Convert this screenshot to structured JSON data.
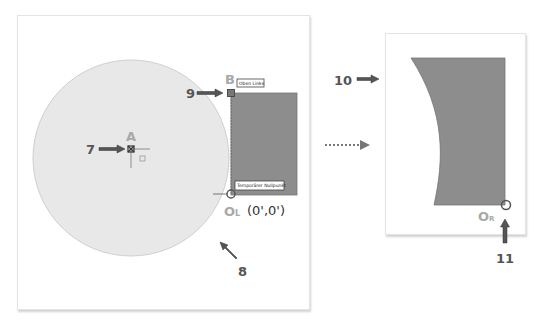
{
  "colors": {
    "circle_fill": "#e8e8e8",
    "circle_stroke": "#c8c8c8",
    "rect_fill": "#8d8d8d",
    "rect_stroke": "#777777",
    "arrow": "#555555",
    "point_label": "#a8a8a8"
  },
  "left_diagram": {
    "point_a_label": "A",
    "point_b_label": "B",
    "origin_label": "OL",
    "origin_label_main": "O",
    "origin_label_sub": "L",
    "origin_coords": "(0',0')",
    "tag_top_left": "Oben Links",
    "tag_temp_origin": "Temporärer Nullpunkt",
    "callouts": {
      "c7": "7",
      "c8": "8",
      "c9": "9"
    }
  },
  "right_diagram": {
    "origin_label_main": "O",
    "origin_label_sub": "R",
    "callouts": {
      "c10": "10",
      "c11": "11"
    }
  },
  "transition_arrow": "dotted-right-arrow"
}
